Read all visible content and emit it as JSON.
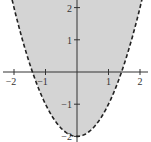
{
  "chart_data": {
    "type": "area",
    "title": "",
    "xlabel": "",
    "ylabel": "",
    "boundary": {
      "equation": "y = x^2 - 2",
      "style": "dashed",
      "vertex": [
        0,
        -2
      ],
      "x_intercepts": [
        -1.414,
        1.414
      ]
    },
    "shaded_region": "above the parabola",
    "xlim": [
      -2.3,
      2.3
    ],
    "ylim": [
      -2.1,
      2.3
    ],
    "x_ticks": [
      -2,
      -1,
      1,
      2
    ],
    "y_ticks": [
      2,
      1,
      -1,
      -2
    ],
    "x_tick_labels": [
      "−2",
      "−1",
      "1",
      "2"
    ],
    "y_tick_labels": [
      "2",
      "1",
      "−1",
      "−2"
    ],
    "grid": false,
    "legend": null,
    "colors": {
      "fill": "#d4d4d4",
      "curve": "#222222",
      "axes": "#333333"
    }
  }
}
